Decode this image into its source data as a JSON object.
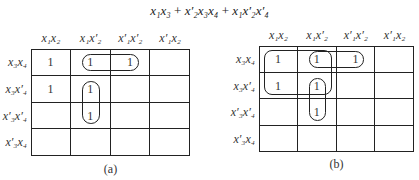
{
  "expression": {
    "terms": [
      "x₁x₃",
      "x′₂x₃x₄",
      "x₁x′₂x′₄"
    ],
    "operator": "+"
  },
  "column_headers": [
    "x₁x₂",
    "x₁x′₂",
    "x′₁x′₂",
    "x′₁x₂"
  ],
  "row_headers": [
    "x₃x₄",
    "x₃x′₄",
    "x′₃x′₄",
    "x′₃x₄"
  ],
  "maps": [
    {
      "caption": "(a)",
      "cells": [
        [
          "1",
          "1",
          "1",
          ""
        ],
        [
          "1",
          "1",
          "",
          ""
        ],
        [
          "",
          "1",
          "",
          ""
        ],
        [
          "",
          "",
          "",
          ""
        ]
      ],
      "loops": [
        {
          "rows": [
            0,
            0
          ],
          "cols": [
            1,
            2
          ]
        },
        {
          "rows": [
            1,
            2
          ],
          "cols": [
            1,
            1
          ]
        }
      ]
    },
    {
      "caption": "(b)",
      "cells": [
        [
          "1",
          "1",
          "1",
          ""
        ],
        [
          "1",
          "1",
          "",
          ""
        ],
        [
          "",
          "1",
          "",
          ""
        ],
        [
          "",
          "",
          "",
          ""
        ]
      ],
      "loops": [
        {
          "rows": [
            0,
            1
          ],
          "cols": [
            0,
            1
          ]
        },
        {
          "rows": [
            0,
            0
          ],
          "cols": [
            1,
            2
          ]
        },
        {
          "rows": [
            1,
            2
          ],
          "cols": [
            1,
            1
          ]
        }
      ]
    }
  ]
}
